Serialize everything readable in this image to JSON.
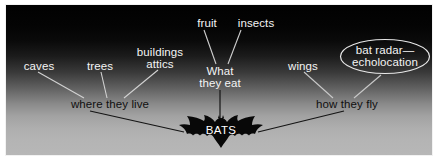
{
  "diagram": {
    "type": "concept-map",
    "center": {
      "label": "BATS",
      "icon": "bat-silhouette-icon"
    },
    "branches": [
      {
        "id": "where-they-live",
        "label": "where they live",
        "children": [
          "caves",
          "trees",
          "buildings attics"
        ]
      },
      {
        "id": "what-they-eat",
        "label_line1": "What",
        "label_line2": "they eat",
        "children": [
          "fruit",
          "insects"
        ]
      },
      {
        "id": "how-they-fly",
        "label": "how they fly",
        "children": [
          "wings",
          "bat radar— echolocation"
        ]
      }
    ],
    "nodes": {
      "fruit": "fruit",
      "insects": "insects",
      "caves": "caves",
      "trees": "trees",
      "buildings": "buildings",
      "attics": "attics",
      "wings": "wings",
      "bat_radar_line1": "bat radar—",
      "bat_radar_line2": "echolocation",
      "what_they_eat_line1": "What",
      "what_they_eat_line2": "they eat",
      "where_they_live": "where they live",
      "how_they_fly": "how they fly",
      "bats": "BATS"
    },
    "colors": {
      "background_top": "#000000",
      "background_bottom": "#b7b7b7",
      "text_light": "#f4f4f4",
      "text_dark": "#101010",
      "bat_fill": "#0a0a0a",
      "bat_text": "#ffffff",
      "ellipse_stroke": "#e8e8e8",
      "line_light": "#d8d8d8",
      "line_dark": "#141414",
      "frame": "#ffffff"
    }
  }
}
